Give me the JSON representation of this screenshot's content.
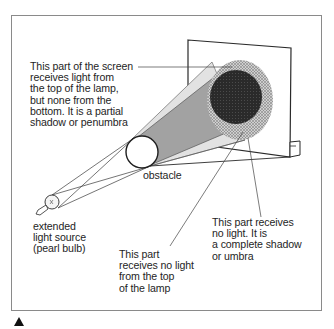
{
  "diagram": {
    "labels": {
      "penumbra": "This part of the screen\nreceives light from\nthe top of the lamp,\nbut none from the\nbottom. It is a partial\nshadow or penumbra",
      "obstacle": "obstacle",
      "light_source": "extended\nlight source\n(pearl bulb)",
      "no_light_top": "This part\nreceives no light\nfrom the top\nof the lamp",
      "umbra": "This part receives\nno light. It is\na complete shadow\nor umbra"
    },
    "colors": {
      "line": "#2a2a2a",
      "cone_light": "#dcdcdc",
      "cone_mid": "#9e9e9e",
      "umbra": "#2b2b2b",
      "penumbra": "#b8b8b8",
      "frame": "#8a8a8a"
    },
    "marker_icon": "triangle-up-icon"
  }
}
